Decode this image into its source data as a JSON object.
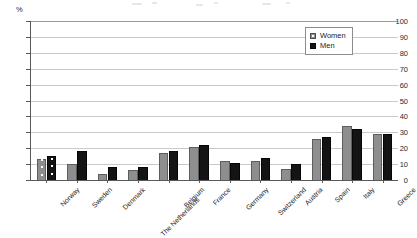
{
  "chart_data": {
    "type": "bar",
    "title": "",
    "subtitle": "",
    "xlabel": "",
    "ylabel": "%",
    "ylim": [
      0,
      100
    ],
    "ytick_interval": 10,
    "yticks": [
      0,
      10,
      20,
      30,
      40,
      50,
      60,
      70,
      80,
      90,
      100
    ],
    "grid": true,
    "grid_axis": "y",
    "legend_position": "top-right",
    "categories": [
      "Norway",
      "Sweden",
      "Denmark",
      "The Netherlands",
      "Belgium",
      "France",
      "Germany",
      "Switzerland",
      "Austria",
      "Spain",
      "Italy",
      "Greece"
    ],
    "series": [
      {
        "name": "Women",
        "color": "#8e8e8e",
        "values": [
          13,
          10,
          4,
          6,
          17,
          21,
          12,
          12,
          7,
          26,
          34,
          29
        ]
      },
      {
        "name": "Men",
        "color": "#141414",
        "values": [
          15,
          18,
          8,
          8,
          18,
          22,
          11,
          14,
          10,
          27,
          32,
          29
        ]
      }
    ]
  },
  "axis": {
    "unit_label": "%"
  },
  "legend": {
    "entries": [
      {
        "label": "Women",
        "swatch": "women-swatch-icon"
      },
      {
        "label": "Men",
        "swatch": "men-swatch-icon"
      }
    ]
  }
}
